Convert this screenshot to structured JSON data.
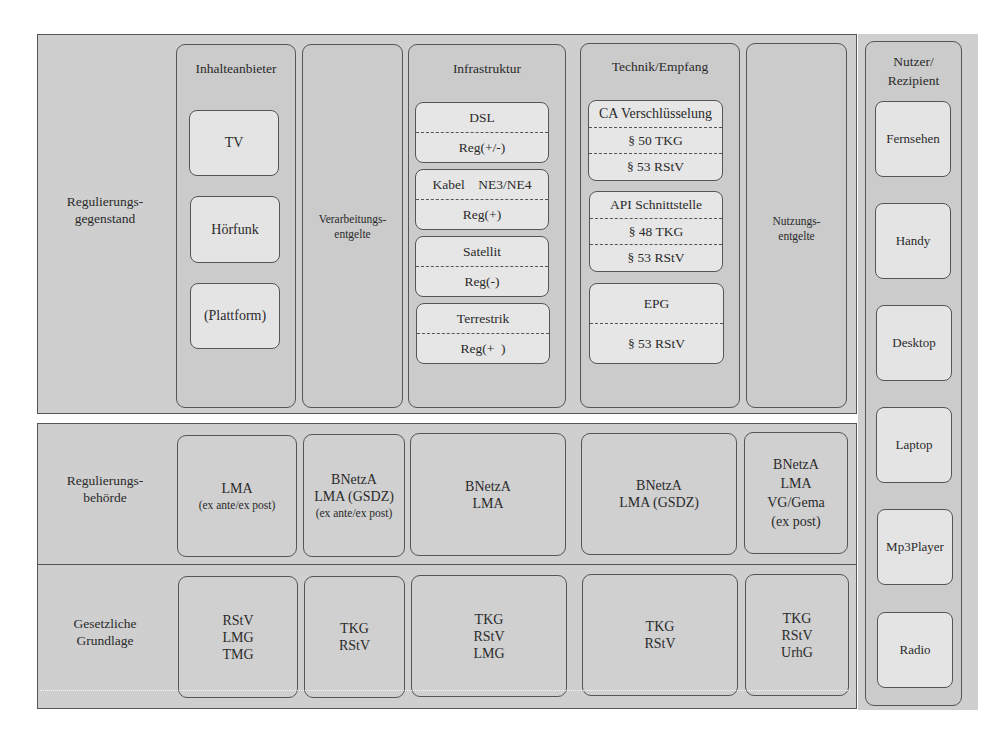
{
  "diagram": {
    "rows": {
      "gegenstand": {
        "label": "Regulierungs-\ngegenstand"
      },
      "behoerde": {
        "label": "Regulierungs-\nbehörde"
      },
      "grundlage": {
        "label": "Gesetzliche\nGrundlage"
      }
    },
    "columns": {
      "inhalteanbieter": {
        "title": "Inhalteanbieter",
        "items": [
          "TV",
          "Hörfunk",
          "(Plattform)"
        ]
      },
      "verarbeitung": {
        "label": "Verarbeitungs-\nentgelte"
      },
      "infrastruktur": {
        "title": "Infrastruktur",
        "items": [
          {
            "name": "DSL",
            "reg": "Reg(+/-)"
          },
          {
            "name": "Kabel    NE3/NE4",
            "reg": "Reg(+)"
          },
          {
            "name": "Satellit",
            "reg": "Reg(-)"
          },
          {
            "name": "Terrestrik",
            "reg": "Reg(+  )"
          }
        ]
      },
      "technik": {
        "title": "Technik/Empfang",
        "items": [
          {
            "name": "CA Verschlüsselung",
            "refs": [
              "§ 50 TKG",
              "§ 53 RStV"
            ]
          },
          {
            "name": "API Schnittstelle",
            "refs": [
              "§ 48 TKG",
              "§ 53 RStV"
            ]
          },
          {
            "name": "EPG",
            "refs": [
              "§ 53 RStV"
            ]
          }
        ]
      },
      "nutzung": {
        "label": "Nutzungs-\nentgelte"
      }
    },
    "behoerde_cells": [
      {
        "lines": [
          "LMA"
        ],
        "note": "(ex ante/ex post)"
      },
      {
        "lines": [
          "BNetzA",
          "LMA (GSDZ)"
        ],
        "note": "(ex ante/ex post)"
      },
      {
        "lines": [
          "BNetzA",
          "LMA"
        ],
        "note": ""
      },
      {
        "lines": [
          "BNetzA",
          "LMA (GSDZ)"
        ],
        "note": ""
      },
      {
        "lines": [
          "BNetzA",
          "LMA",
          "VG/Gema",
          "(ex post)"
        ],
        "note": ""
      }
    ],
    "grundlage_cells": [
      {
        "lines": [
          "RStV",
          "LMG",
          "TMG"
        ]
      },
      {
        "lines": [
          "TKG",
          "RStV"
        ]
      },
      {
        "lines": [
          "TKG",
          "RStV",
          "LMG"
        ]
      },
      {
        "lines": [
          "TKG",
          "RStV"
        ]
      },
      {
        "lines": [
          "TKG",
          "RStV",
          "UrhG"
        ]
      }
    ],
    "nutzer": {
      "title": "Nutzer/\nRezipient",
      "items": [
        "Fernsehen",
        "Handy",
        "Desktop",
        "Laptop",
        "Mp3Player",
        "Radio"
      ]
    }
  }
}
